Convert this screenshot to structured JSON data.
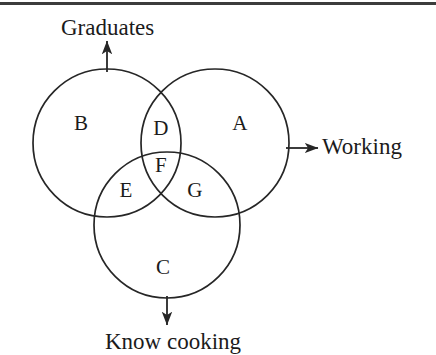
{
  "figure": {
    "type": "venn-diagram",
    "set_count": 3,
    "background_color": "#ffffff",
    "stroke_color": "#262626",
    "text_color": "#1b1b1b",
    "top_rule_color": "#3c3c3c"
  },
  "sets": [
    {
      "key": "graduates",
      "axis_label": "Graduates",
      "arrow_direction": "up",
      "circle": {
        "cx": 107,
        "cy": 143,
        "r": 74
      }
    },
    {
      "key": "working",
      "axis_label": "Working",
      "arrow_direction": "right",
      "circle": {
        "cx": 215,
        "cy": 143,
        "r": 74
      }
    },
    {
      "key": "know_cooking",
      "axis_label": "Know cooking",
      "arrow_direction": "down",
      "circle": {
        "cx": 167,
        "cy": 225,
        "r": 73
      }
    }
  ],
  "regions": [
    {
      "id": "A",
      "label": "A",
      "x": 240,
      "y": 123,
      "meaning": "Working only"
    },
    {
      "id": "B",
      "label": "B",
      "x": 81,
      "y": 123,
      "meaning": "Graduates only"
    },
    {
      "id": "C",
      "label": "C",
      "x": 163,
      "y": 267,
      "meaning": "Know cooking only"
    },
    {
      "id": "D",
      "label": "D",
      "x": 161,
      "y": 128,
      "meaning": "Graduates and Working"
    },
    {
      "id": "E",
      "label": "E",
      "x": 126,
      "y": 190,
      "meaning": "Graduates and Know cooking"
    },
    {
      "id": "F",
      "label": "F",
      "x": 161,
      "y": 165,
      "meaning": "Graduates, Working and Know cooking"
    },
    {
      "id": "G",
      "label": "G",
      "x": 195,
      "y": 190,
      "meaning": "Working and Know cooking"
    }
  ],
  "arrows": {
    "graduates": {
      "from_x": 107,
      "from_y": 72,
      "to_x": 107,
      "to_y": 41
    },
    "working": {
      "from_x": 286,
      "from_y": 148,
      "to_x": 318,
      "to_y": 148
    },
    "know_cooking": {
      "from_x": 167,
      "from_y": 296,
      "to_x": 167,
      "to_y": 325
    }
  }
}
